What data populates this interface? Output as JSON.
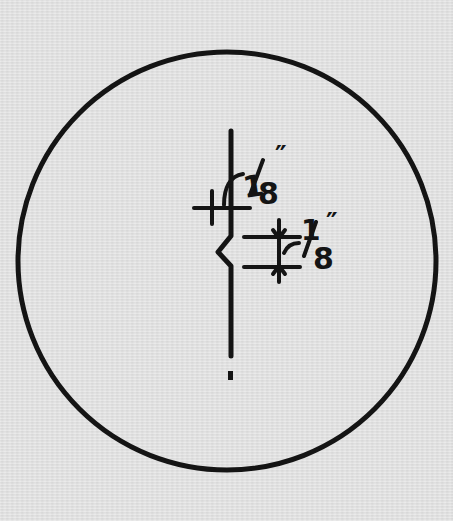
{
  "diagram": {
    "colors": {
      "background": "#e2e2e2",
      "ink": "#141414"
    },
    "detail_circle": {
      "cx": 227,
      "cy": 261,
      "r": 209
    },
    "dimensions": [
      {
        "id": "upper",
        "value_numerator": "1",
        "value_denominator": "8",
        "unit": "″",
        "label": "1/8\""
      },
      {
        "id": "lower",
        "value_numerator": "1",
        "value_denominator": "8",
        "unit": "″",
        "label": "1/8\""
      }
    ]
  }
}
